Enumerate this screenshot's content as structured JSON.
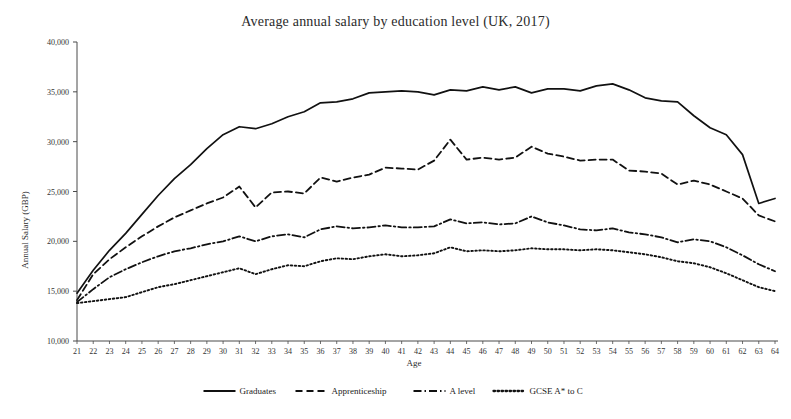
{
  "chart_data": {
    "type": "line",
    "title": "Average annual salary by education level (UK, 2017)",
    "xlabel": "Age",
    "ylabel": "Annual Salary (GBP)",
    "xlim": [
      21,
      64
    ],
    "ylim": [
      10000,
      40000
    ],
    "ytick_values": [
      10000,
      15000,
      20000,
      25000,
      30000,
      35000,
      40000
    ],
    "ytick_labels": [
      "10,000",
      "15,000",
      "20,000",
      "25,000",
      "30,000",
      "35,000",
      "40,000"
    ],
    "grid": false,
    "legend_position": "bottom",
    "x": [
      21,
      22,
      23,
      24,
      25,
      26,
      27,
      28,
      29,
      30,
      31,
      32,
      33,
      34,
      35,
      36,
      37,
      38,
      39,
      40,
      41,
      42,
      43,
      44,
      45,
      46,
      47,
      48,
      49,
      50,
      51,
      52,
      53,
      54,
      55,
      56,
      57,
      58,
      59,
      60,
      61,
      62,
      63,
      64
    ],
    "series": [
      {
        "name": "Graduates",
        "style": "solid",
        "values": [
          14800,
          17100,
          19100,
          20800,
          22700,
          24600,
          26300,
          27700,
          29300,
          30700,
          31500,
          31300,
          31800,
          32500,
          33000,
          33900,
          34000,
          34300,
          34900,
          35000,
          35100,
          35000,
          34700,
          35200,
          35100,
          35500,
          35200,
          35500,
          34900,
          35300,
          35300,
          35100,
          35600,
          35800,
          35200,
          34400,
          34100,
          34000,
          32600,
          31400,
          30700,
          28700,
          23800,
          24300
        ]
      },
      {
        "name": "Apprenticeship",
        "style": "dashed",
        "values": [
          14100,
          16700,
          18200,
          19400,
          20500,
          21500,
          22400,
          23100,
          23800,
          24400,
          25500,
          23400,
          24900,
          25000,
          24800,
          26400,
          26000,
          26400,
          26700,
          27400,
          27300,
          27200,
          28100,
          30200,
          28200,
          28400,
          28200,
          28400,
          29500,
          28800,
          28500,
          28100,
          28200,
          28200,
          27100,
          27000,
          26800,
          25700,
          26100,
          25700,
          25000,
          24300,
          22600,
          22000
        ]
      },
      {
        "name": "A level",
        "style": "dashdot",
        "values": [
          13900,
          15200,
          16400,
          17200,
          17900,
          18500,
          19000,
          19300,
          19700,
          20000,
          20500,
          20000,
          20500,
          20700,
          20400,
          21200,
          21500,
          21300,
          21400,
          21600,
          21400,
          21400,
          21500,
          22200,
          21800,
          21900,
          21700,
          21800,
          22500,
          21900,
          21600,
          21200,
          21100,
          21300,
          20900,
          20700,
          20400,
          19900,
          20200,
          20000,
          19400,
          18600,
          17700,
          17000
        ]
      },
      {
        "name": "GCSE A* to C",
        "style": "dotted",
        "values": [
          13800,
          14000,
          14200,
          14400,
          14900,
          15400,
          15700,
          16100,
          16500,
          16900,
          17300,
          16700,
          17200,
          17600,
          17500,
          18000,
          18300,
          18200,
          18500,
          18700,
          18500,
          18600,
          18800,
          19400,
          19000,
          19100,
          19000,
          19100,
          19300,
          19200,
          19200,
          19100,
          19200,
          19100,
          18900,
          18700,
          18400,
          18000,
          17800,
          17400,
          16800,
          16100,
          15400,
          15000
        ]
      }
    ]
  },
  "legend": {
    "items": [
      {
        "label": "Graduates",
        "style": "solid"
      },
      {
        "label": "Apprenticeship",
        "style": "dashed"
      },
      {
        "label": "A level",
        "style": "dashdot"
      },
      {
        "label": "GCSE A* to C",
        "style": "dotted"
      }
    ]
  }
}
